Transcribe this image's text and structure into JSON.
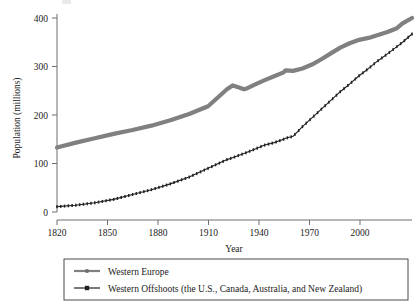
{
  "figure": {
    "background": "#ffffff",
    "axis_color": "#6e6e6e",
    "text_color": "#1a1a1a"
  },
  "chart_data": {
    "type": "line",
    "title": "",
    "xlabel": "Year",
    "ylabel": "Population (millions)",
    "xlim": [
      1820,
      2008
    ],
    "ylim": [
      0,
      420
    ],
    "xticks": [
      1820,
      1850,
      1880,
      1910,
      1940,
      1970,
      2000
    ],
    "xtick_labels": [
      "1820",
      "1850",
      "1880",
      "1910",
      "1940",
      "1970",
      "2000"
    ],
    "yticks": [
      0,
      100,
      200,
      300,
      400
    ],
    "ytick_labels": [
      "0",
      "100",
      "200",
      "300",
      "400"
    ],
    "grid": false,
    "legend_position": "below-axes",
    "series": [
      {
        "name": "Western Europe",
        "color": "#808080",
        "line_width": 4.2,
        "marker": "circle",
        "x": [
          1820,
          1830,
          1840,
          1850,
          1860,
          1870,
          1880,
          1890,
          1900,
          1910,
          1913,
          1916,
          1919,
          1920,
          1925,
          1930,
          1935,
          1940,
          1941,
          1945,
          1950,
          1955,
          1960,
          1965,
          1970,
          1975,
          1980,
          1985,
          1990,
          1995,
          2000,
          2003,
          2008
        ],
        "y": [
          133,
          143,
          152,
          161,
          169,
          178,
          189,
          202,
          218,
          253,
          261,
          257,
          253,
          254,
          263,
          272,
          280,
          288,
          292,
          291,
          296,
          304,
          315,
          327,
          339,
          348,
          355,
          359,
          365,
          371,
          379,
          389,
          400
        ]
      },
      {
        "name": "Western Offshoots (the U.S., Canada, Australia, and New Zealand)",
        "color": "#222222",
        "line_width": 1.1,
        "marker": "square",
        "x": [
          1820,
          1830,
          1840,
          1850,
          1860,
          1870,
          1880,
          1890,
          1900,
          1910,
          1913,
          1920,
          1925,
          1930,
          1935,
          1940,
          1941,
          1945,
          1950,
          1955,
          1960,
          1965,
          1970,
          1975,
          1980,
          1985,
          1990,
          1995,
          2000,
          2003,
          2008
        ],
        "y": [
          11,
          14,
          19,
          26,
          36,
          46,
          58,
          72,
          90,
          108,
          112,
          122,
          130,
          138,
          143,
          150,
          152,
          156,
          176,
          194,
          212,
          230,
          248,
          264,
          281,
          296,
          312,
          326,
          341,
          350,
          367
        ]
      }
    ],
    "annotations": []
  },
  "legend": {
    "entries": [
      {
        "label": "Western Europe",
        "marker": "line-circle",
        "color": "#808080"
      },
      {
        "label": "Western Offshoots (the U.S., Canada, Australia, and New Zealand)",
        "marker": "line-square",
        "color": "#222222"
      }
    ]
  }
}
